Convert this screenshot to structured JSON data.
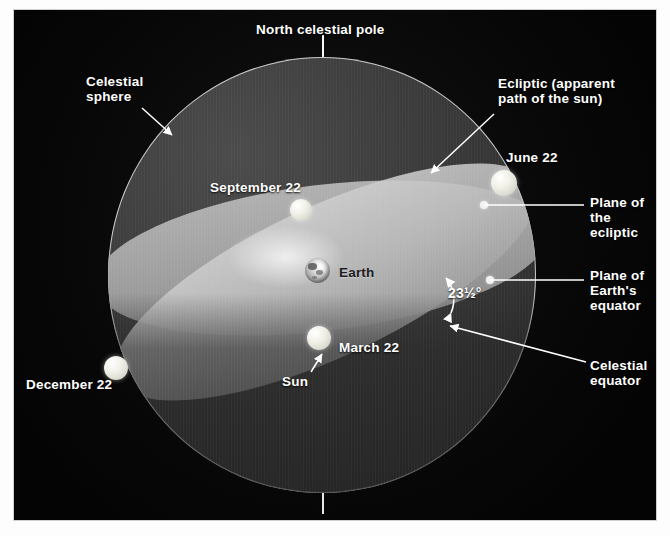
{
  "figure": {
    "background_color": "#050505",
    "sphere_color": "#3c3c3c",
    "ecliptic_band_color": "#c4c4c4",
    "equator_band_color": "#a6a6a6",
    "label_color": "#ffffff",
    "earth_label_color": "#1d1d1d"
  },
  "labels": {
    "north_celestial_pole": "North celestial pole",
    "celestial_sphere": "Celestial\nsphere",
    "ecliptic": "Ecliptic (apparent\npath of the sun)",
    "june22": "June 22",
    "september22": "September 22",
    "march22": "March 22",
    "december22": "December 22",
    "earth": "Earth",
    "sun": "Sun",
    "plane_of_ecliptic": "Plane of\nthe ecliptic",
    "plane_of_earths_equator": "Plane of\nEarth's\nequator",
    "celestial_equator": "Celestial\nequator",
    "tilt_value": "23",
    "tilt_fraction": "1/2",
    "tilt_degree": "°",
    "tilt_full": "23½°"
  },
  "markers": [
    {
      "name": "june-22-sun",
      "label": "June 22",
      "x": 490,
      "y": 173
    },
    {
      "name": "september-22-sun",
      "label": "September 22",
      "x": 287,
      "y": 200
    },
    {
      "name": "march-22-sun",
      "label": "March 22",
      "x": 305,
      "y": 328
    },
    {
      "name": "december-22-sun",
      "label": "December 22",
      "x": 102,
      "y": 358
    },
    {
      "name": "earth",
      "label": "Earth",
      "x": 303,
      "y": 260
    }
  ],
  "planes": [
    {
      "name": "ecliptic",
      "label": "Plane of the ecliptic",
      "tilt_degrees": 23.5
    },
    {
      "name": "celestial-equator",
      "label": "Plane of Earth's equator",
      "tilt_degrees": 0
    }
  ]
}
